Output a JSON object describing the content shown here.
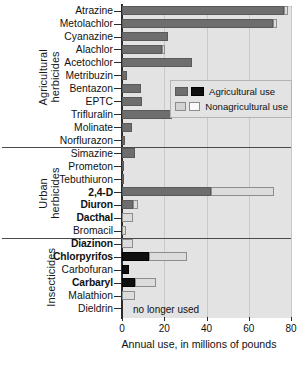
{
  "chart_data": {
    "type": "bar",
    "orientation": "horizontal",
    "title": "",
    "xlabel": "Annual use, in millions of pounds",
    "ylabel": "",
    "xlim": [
      0,
      80
    ],
    "xticks": [
      0,
      20,
      40,
      60,
      80
    ],
    "xtick_labels": [
      "0",
      "20",
      "40",
      "60",
      "80"
    ],
    "grid": true,
    "legend_position": "inside-upper-right",
    "legend": [
      {
        "label": "Agricultural use",
        "colors": [
          "#6e6e6e",
          "#0f0f0f"
        ]
      },
      {
        "label": "Nonagricultural use",
        "colors": [
          "#d2d2d2",
          "#fafafa"
        ]
      }
    ],
    "series": [
      {
        "name": "Agricultural use",
        "color": "#6e6e6e"
      },
      {
        "name": "Nonagricultural use",
        "color": "#dcdcdc"
      }
    ],
    "groups": [
      {
        "name": "Agricultural\nherbicides",
        "bar_style": "gray",
        "categories": [
          {
            "label": "Atrazine",
            "bold": false,
            "agricultural": 76.5,
            "nonagricultural": 2.0
          },
          {
            "label": "Metolachlor",
            "bold": false,
            "agricultural": 71.5,
            "nonagricultural": 2.0
          },
          {
            "label": "Cyanazine",
            "bold": false,
            "agricultural": 22.0,
            "nonagricultural": 0.0
          },
          {
            "label": "Alachlor",
            "bold": false,
            "agricultural": 19.0,
            "nonagricultural": 1.5
          },
          {
            "label": "Acetochlor",
            "bold": false,
            "agricultural": 33.0,
            "nonagricultural": 0.0
          },
          {
            "label": "Metribuzin",
            "bold": false,
            "agricultural": 2.5,
            "nonagricultural": 0.0
          },
          {
            "label": "Bentazon",
            "bold": false,
            "agricultural": 9.0,
            "nonagricultural": 0.0
          },
          {
            "label": "EPTC",
            "bold": false,
            "agricultural": 9.5,
            "nonagricultural": 0.0
          },
          {
            "label": "Trifluralin",
            "bold": false,
            "agricultural": 23.5,
            "nonagricultural": 0.0
          },
          {
            "label": "Molinate",
            "bold": false,
            "agricultural": 4.5,
            "nonagricultural": 0.0
          },
          {
            "label": "Norflurazon",
            "bold": false,
            "agricultural": 1.5,
            "nonagricultural": 0.0
          }
        ]
      },
      {
        "name": "Urban\nherbicides",
        "bar_style": "gray",
        "categories": [
          {
            "label": "Simazine",
            "bold": false,
            "agricultural": 6.0,
            "nonagricultural": 0.0
          },
          {
            "label": "Prometon",
            "bold": false,
            "agricultural": 0.4,
            "nonagricultural": 0.0
          },
          {
            "label": "Tebuthiuron",
            "bold": false,
            "agricultural": 0.4,
            "nonagricultural": 0.0
          },
          {
            "label": "2,4-D",
            "bold": true,
            "agricultural": 42.0,
            "nonagricultural": 30.0
          },
          {
            "label": "Diuron",
            "bold": true,
            "agricultural": 5.0,
            "nonagricultural": 2.5
          },
          {
            "label": "Dacthal",
            "bold": true,
            "agricultural": 0.0,
            "nonagricultural": 5.0
          },
          {
            "label": "Bromacil",
            "bold": false,
            "agricultural": 0.0,
            "nonagricultural": 2.0
          }
        ]
      },
      {
        "name": "Insecticides",
        "bar_style": "black",
        "categories": [
          {
            "label": "Diazinon",
            "bold": true,
            "agricultural": 0.0,
            "nonagricultural": 5.0
          },
          {
            "label": "Chlorpyrifos",
            "bold": true,
            "agricultural": 13.0,
            "nonagricultural": 18.0
          },
          {
            "label": "Carbofuran",
            "bold": false,
            "agricultural": 3.5,
            "nonagricultural": 0.0
          },
          {
            "label": "Carbaryl",
            "bold": true,
            "agricultural": 6.0,
            "nonagricultural": 10.0
          },
          {
            "label": "Malathion",
            "bold": false,
            "agricultural": 0.0,
            "nonagricultural": 6.0
          },
          {
            "label": "Dieldrin",
            "bold": false,
            "agricultural": 0.0,
            "nonagricultural": 0.0,
            "annotation": "no longer used"
          }
        ]
      }
    ]
  }
}
